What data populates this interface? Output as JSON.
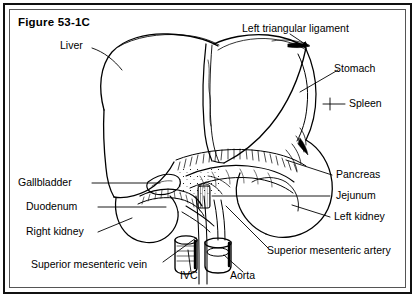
{
  "figure": {
    "title": "Figure 53-1C",
    "frame_color": "#111111",
    "inner_frame_color": "#555555",
    "ink_color": "#000000",
    "background": "#ffffff"
  },
  "labels": {
    "liver": "Liver",
    "left_triangular_ligament": "Left triangular ligament",
    "stomach": "Stomach",
    "spleen": "Spleen",
    "pancreas": "Pancreas",
    "jejunum": "Jejunum",
    "left_kidney": "Left kidney",
    "superior_mesenteric_artery": "Superior mesenteric artery",
    "aorta": "Aorta",
    "ivc": "IVC",
    "superior_mesenteric_vein": "Superior mesenteric vein",
    "right_kidney": "Right kidney",
    "duodenum": "Duodenum",
    "gallbladder": "Gallbladder"
  }
}
